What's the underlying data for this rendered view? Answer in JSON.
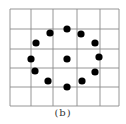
{
  "figure": {
    "caption": "(b)",
    "grid": {
      "x_lines": [
        10,
        31,
        53,
        77,
        100,
        119
      ],
      "y_lines": [
        9,
        29,
        49,
        68,
        87,
        106
      ],
      "line_color": "#8a8a8a"
    },
    "dots": [
      {
        "x": 67,
        "y": 29
      },
      {
        "x": 50,
        "y": 33
      },
      {
        "x": 81,
        "y": 34
      },
      {
        "x": 36,
        "y": 43
      },
      {
        "x": 95,
        "y": 43
      },
      {
        "x": 31,
        "y": 59
      },
      {
        "x": 67,
        "y": 59
      },
      {
        "x": 99,
        "y": 57
      },
      {
        "x": 35,
        "y": 71
      },
      {
        "x": 95,
        "y": 72
      },
      {
        "x": 48,
        "y": 81
      },
      {
        "x": 82,
        "y": 81
      },
      {
        "x": 67,
        "y": 87
      }
    ],
    "dot_radius": 3.6,
    "dot_color": "#000000"
  }
}
